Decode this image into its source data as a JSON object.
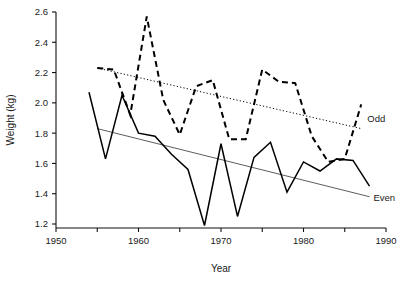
{
  "chart_data": {
    "type": "line",
    "title": "",
    "xlabel": "Year",
    "ylabel": "Weight (kg)",
    "xlim": [
      1950,
      1990
    ],
    "ylim": [
      1.1,
      2.65
    ],
    "grid": false,
    "legend_position": "right-inline",
    "xticks": [
      1950,
      1955,
      1960,
      1965,
      1970,
      1975,
      1980,
      1985,
      1990
    ],
    "xtick_labels": [
      "1950",
      "",
      "1960",
      "",
      "1970",
      "",
      "1980",
      "",
      "1990"
    ],
    "yticks": [
      1.2,
      1.4,
      1.6,
      1.8,
      2.0,
      2.2,
      2.4,
      2.6
    ],
    "ytick_labels": [
      "1.2",
      "1.4",
      "1.6",
      "1.8",
      "2.0",
      "2.2",
      "2.4",
      "2.6"
    ],
    "series": [
      {
        "name": "Odd",
        "label": "Odd",
        "style": "dashed",
        "color": "#000000",
        "x": [
          1955,
          1957,
          1959,
          1961,
          1963,
          1965,
          1967,
          1969,
          1971,
          1973,
          1975,
          1977,
          1979,
          1981,
          1983,
          1985,
          1987
        ],
        "values": [
          2.23,
          2.22,
          1.92,
          2.57,
          2.02,
          1.79,
          2.11,
          2.15,
          1.76,
          1.76,
          2.22,
          2.14,
          2.13,
          1.78,
          1.61,
          1.63,
          1.99
        ]
      },
      {
        "name": "Even",
        "label": "Even",
        "style": "solid",
        "color": "#000000",
        "x": [
          1954,
          1956,
          1958,
          1960,
          1962,
          1964,
          1966,
          1968,
          1970,
          1972,
          1974,
          1976,
          1978,
          1980,
          1982,
          1984,
          1986,
          1988
        ],
        "values": [
          2.07,
          1.63,
          2.05,
          1.8,
          1.78,
          1.66,
          1.56,
          1.19,
          1.73,
          1.25,
          1.64,
          1.74,
          1.41,
          1.61,
          1.55,
          1.63,
          1.62,
          1.45
        ]
      }
    ],
    "trend_lines": [
      {
        "name": "odd-trend",
        "style": "dotted",
        "x": [
          1955,
          1987
        ],
        "values": [
          2.23,
          1.83
        ]
      },
      {
        "name": "even-trend",
        "style": "solid-thin",
        "x": [
          1955,
          1988
        ],
        "values": [
          1.83,
          1.38
        ]
      }
    ]
  },
  "labels": {
    "odd": "Odd",
    "even": "Even",
    "y_axis_title": "Weight (kg)",
    "x_axis_title": "Year"
  }
}
